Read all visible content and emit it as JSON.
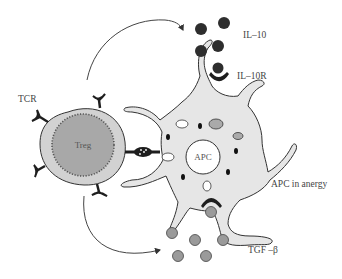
{
  "diagram": {
    "labels": {
      "tcr": "TCR",
      "treg": "Treg",
      "apc": "APC",
      "il10": "IL–10",
      "il10r": "IL–10R",
      "apc_state": "APC in anergy",
      "tgfb": "TGF –β"
    },
    "colors": {
      "treg_outer": "#d2d2d2",
      "treg_inner": "#a8a8a8",
      "apc_body": "#e6e6e6",
      "il10_particle": "#2e2e2e",
      "tgfb_particle": "#9a9a9a",
      "receptor": "#1e1e1e",
      "outline": "#333333"
    },
    "counts": {
      "il10_particles": 5,
      "tgfb_particles": 6,
      "tcr_receptors": 5
    }
  }
}
